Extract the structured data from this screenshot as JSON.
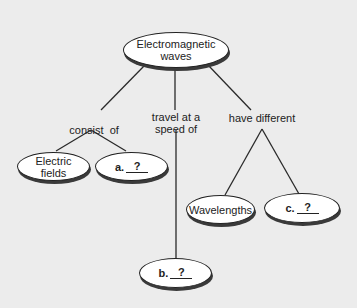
{
  "diagram": {
    "type": "concept-map",
    "background": "#ececec",
    "root": {
      "label": "Electromagnetic waves",
      "line1": "Electromagnetic",
      "line2": "waves"
    },
    "links": {
      "consist_of": "consist  of",
      "travel_line1": "travel at a",
      "travel_line2": "speed of",
      "have_different": "have different"
    },
    "nodes": {
      "electric_fields": {
        "line1": "Electric",
        "line2": "fields"
      },
      "a": {
        "prefix": "a.",
        "blank": "?"
      },
      "b": {
        "prefix": "b.",
        "blank": "?"
      },
      "wavelengths": {
        "label": "Wavelengths"
      },
      "c": {
        "prefix": "c.",
        "blank": "?"
      }
    }
  }
}
